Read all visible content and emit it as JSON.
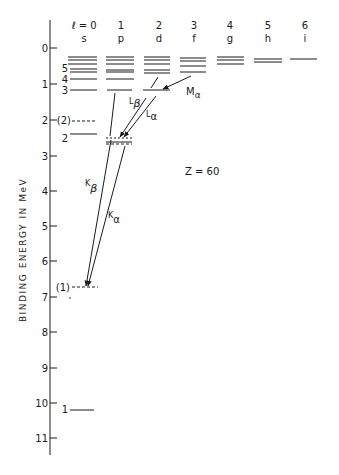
{
  "figure": {
    "ylabel": "BINDING ENERGY IN MeV",
    "annotation": "Z = 60",
    "columns": [
      {
        "l": "ℓ = 0",
        "letter": "s"
      },
      {
        "l": "1",
        "letter": "p"
      },
      {
        "l": "2",
        "letter": "d"
      },
      {
        "l": "3",
        "letter": "f"
      },
      {
        "l": "4",
        "letter": "g"
      },
      {
        "l": "5",
        "letter": "h"
      },
      {
        "l": "6",
        "letter": "i"
      }
    ],
    "y_ticks": [
      "0",
      "1",
      "2",
      "3",
      "4",
      "5",
      "6",
      "7",
      "8",
      "9",
      "10",
      "11"
    ],
    "level_labels": {
      "n5": "5",
      "n4": "4",
      "n3": "3",
      "n2": "2",
      "n2_muonic": "(2)",
      "n1_muonic": "(1)",
      "n1": "1"
    },
    "transitions": {
      "M_alpha": {
        "main": "M",
        "sub": "α"
      },
      "L_beta": {
        "main": "L",
        "sub": "β"
      },
      "L_alpha": {
        "main": "L",
        "sub": "α"
      },
      "K_beta": {
        "main": "K",
        "sub": "β"
      },
      "K_alpha": {
        "main": "K",
        "sub": "α"
      }
    }
  }
}
